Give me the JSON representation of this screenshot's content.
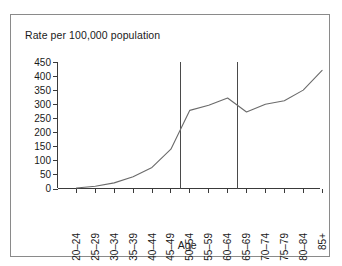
{
  "figure": {
    "background_color": "#ffffff",
    "frame_color": "#8a8a8a",
    "line_color": "#6b6b6b",
    "axis_color": "#3a3a3a"
  },
  "chart_data": {
    "type": "line",
    "title": "Rate per 100,000 population",
    "subtitle": "",
    "xlabel": "Age",
    "ylabel": "",
    "categories": [
      "20–24",
      "25–29",
      "30–34",
      "35–39",
      "40–44",
      "45–49",
      "50–54",
      "55–59",
      "60–64",
      "65–69",
      "70–74",
      "75–79",
      "80–84",
      "85+"
    ],
    "values": [
      2,
      8,
      20,
      42,
      75,
      140,
      278,
      296,
      322,
      272,
      300,
      312,
      350,
      420
    ],
    "series": [
      {
        "name": "Rate per 100,000 population",
        "values": [
          2,
          8,
          20,
          42,
          75,
          140,
          278,
          296,
          322,
          272,
          300,
          312,
          350,
          420
        ]
      }
    ],
    "ylim": [
      0,
      450
    ],
    "yticks": [
      0,
      50,
      100,
      150,
      200,
      250,
      300,
      350,
      400,
      450
    ],
    "ytick_labels": [
      "0",
      "50",
      "100",
      "150",
      "200",
      "250",
      "300",
      "350",
      "400",
      "450"
    ],
    "grid": false,
    "legend": false,
    "legend_position": "none",
    "annotations": [
      {
        "name": "reference-line-1",
        "type": "vline",
        "between": [
          "45–49",
          "50–54"
        ],
        "x_index": 5.5,
        "y_from": 0,
        "y_to": 450
      },
      {
        "name": "reference-line-2",
        "type": "vline",
        "between": [
          "60–64",
          "65–69"
        ],
        "x_index": 8.5,
        "y_from": 0,
        "y_to": 450
      }
    ]
  }
}
